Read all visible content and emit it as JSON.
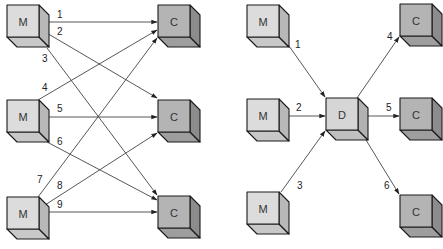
{
  "colors": {
    "m_front": "#dcdcdc",
    "m_top": "#c8c8c8",
    "m_side": "#b8b8b8",
    "c_front": "#b4b4b4",
    "c_top": "#9e9e9e",
    "c_side": "#8c8c8c",
    "d_front": "#d6d6d6",
    "d_top": "#c0c0c0",
    "d_side": "#b2b2b2",
    "edge": "#444444",
    "outline": "#1a1a1a"
  },
  "left_diagram": {
    "title": "",
    "nodes": [
      {
        "id": "M1",
        "label": "M",
        "type": "M"
      },
      {
        "id": "M2",
        "label": "M",
        "type": "M"
      },
      {
        "id": "M3",
        "label": "M",
        "type": "M"
      },
      {
        "id": "C1",
        "label": "C",
        "type": "C"
      },
      {
        "id": "C2",
        "label": "C",
        "type": "C"
      },
      {
        "id": "C3",
        "label": "C",
        "type": "C"
      }
    ],
    "edges": [
      {
        "label": "1",
        "from": "M1",
        "to": "C1"
      },
      {
        "label": "2",
        "from": "M1",
        "to": "C2"
      },
      {
        "label": "3",
        "from": "M1",
        "to": "C3"
      },
      {
        "label": "4",
        "from": "M2",
        "to": "C1"
      },
      {
        "label": "5",
        "from": "M2",
        "to": "C2"
      },
      {
        "label": "6",
        "from": "M2",
        "to": "C3"
      },
      {
        "label": "7",
        "from": "M3",
        "to": "C1"
      },
      {
        "label": "8",
        "from": "M3",
        "to": "C2"
      },
      {
        "label": "9",
        "from": "M3",
        "to": "C3"
      }
    ]
  },
  "right_diagram": {
    "title": "",
    "nodes": [
      {
        "id": "M1",
        "label": "M",
        "type": "M"
      },
      {
        "id": "M2",
        "label": "M",
        "type": "M"
      },
      {
        "id": "M3",
        "label": "M",
        "type": "M"
      },
      {
        "id": "D",
        "label": "D",
        "type": "D"
      },
      {
        "id": "C1",
        "label": "C",
        "type": "C"
      },
      {
        "id": "C2",
        "label": "C",
        "type": "C"
      },
      {
        "id": "C3",
        "label": "C",
        "type": "C"
      }
    ],
    "edges": [
      {
        "label": "1",
        "from": "M1",
        "to": "D"
      },
      {
        "label": "2",
        "from": "M2",
        "to": "D"
      },
      {
        "label": "3",
        "from": "M3",
        "to": "D"
      },
      {
        "label": "4",
        "from": "D",
        "to": "C1"
      },
      {
        "label": "5",
        "from": "D",
        "to": "C2"
      },
      {
        "label": "6",
        "from": "D",
        "to": "C3"
      }
    ]
  }
}
